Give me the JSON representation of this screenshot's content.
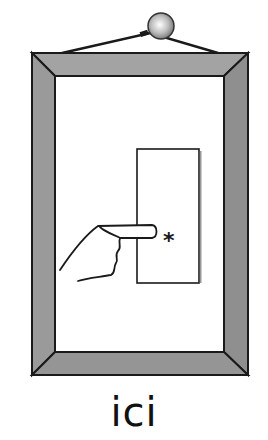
{
  "pictogram": {
    "subject": "hanging picture frame with a hand pointing at a marked spot on a door-like panel",
    "elements": [
      "nail-icon",
      "hanging-wire",
      "picture-frame",
      "panel",
      "pointing-hand-icon",
      "asterisk-mark"
    ],
    "asterisk": "*",
    "colors": {
      "frame_fill": "#9a9a9a",
      "frame_outline": "#1a1a1a",
      "background": "#ffffff",
      "nail": "#c8c8c8"
    }
  },
  "caption": {
    "text": "ici"
  }
}
